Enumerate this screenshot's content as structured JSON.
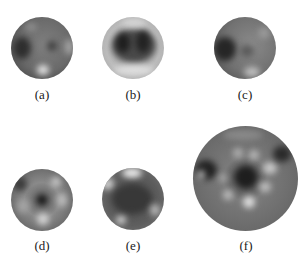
{
  "figure": {
    "panels": [
      {
        "id": "a",
        "label": "(a)",
        "cx": 42,
        "cy": 48,
        "r": 31,
        "base": "#6a6a6a",
        "rim": "#3a3a3a"
      },
      {
        "id": "b",
        "label": "(b)",
        "cx": 133,
        "cy": 48,
        "r": 31,
        "base": "#b5b5b5",
        "rim": "#8a8a8a"
      },
      {
        "id": "c",
        "label": "(c)",
        "cx": 245,
        "cy": 48,
        "r": 31,
        "base": "#707070",
        "rim": "#444444"
      },
      {
        "id": "d",
        "label": "(d)",
        "cx": 42,
        "cy": 200,
        "r": 31,
        "base": "#707070",
        "rim": "#2e2e2e"
      },
      {
        "id": "e",
        "label": "(e)",
        "cx": 133,
        "cy": 198,
        "r": 31,
        "base": "#5a5a5a",
        "rim": "#3a3a3a"
      },
      {
        "id": "f",
        "label": "(f)",
        "cx": 246,
        "cy": 179,
        "r": 52,
        "base": "#6a6a6a",
        "rim": "#2e2e2e"
      }
    ]
  }
}
